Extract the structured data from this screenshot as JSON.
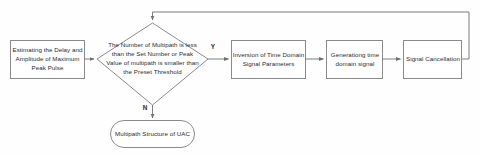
{
  "diagram": {
    "type": "flowchart",
    "colors": {
      "background": "#fefefe",
      "shape_fill": "#ffffff",
      "shape_stroke": "#8a8a8a",
      "connector_stroke": "#7d7d7d",
      "text": "#2b2b2b"
    },
    "nodes": {
      "estimate": {
        "shape": "rectangle",
        "label": "Estimating the Delay and Amplitude of Maximum Peak Pulse",
        "lines": [
          "Estimating the Delay",
          "and Amplitude of",
          "Maximum Peak Pulse"
        ]
      },
      "decision": {
        "shape": "diamond",
        "label": "The Number of Multipath is less than the Set Number or Peak Value of multipath is smaller than the Preset Threshold",
        "lines": [
          "The Number of Multipath is",
          "less than the Set Number or",
          "Peak Value of multipath is",
          "smaller than the Preset",
          "Threshold"
        ]
      },
      "inversion": {
        "shape": "rectangle",
        "label": "Inversion of Time Domain Signal Parameters",
        "lines": [
          "Inversion of Time",
          "Domain Signal",
          "Parameters"
        ]
      },
      "generating": {
        "shape": "rectangle",
        "label": "Generationg time domain signal",
        "lines": [
          "Generationg",
          "time domain",
          "signal"
        ]
      },
      "cancellation": {
        "shape": "rectangle",
        "label": "Signal Cancellation",
        "lines": [
          "Signal",
          "Cancellation"
        ]
      },
      "terminator": {
        "shape": "rounded-terminator",
        "label": "Multipath Structure of UAC",
        "lines": [
          "Multipath Structure of",
          "UAC"
        ]
      }
    },
    "branch_labels": {
      "yes": "Y",
      "no": "N"
    },
    "edges": [
      {
        "from": "estimate",
        "to": "decision",
        "label": ""
      },
      {
        "from": "decision",
        "to": "inversion",
        "label": "Y"
      },
      {
        "from": "decision",
        "to": "terminator",
        "label": "N"
      },
      {
        "from": "inversion",
        "to": "generating",
        "label": ""
      },
      {
        "from": "generating",
        "to": "cancellation",
        "label": ""
      },
      {
        "from": "cancellation",
        "to": "decision",
        "label": ""
      }
    ]
  }
}
